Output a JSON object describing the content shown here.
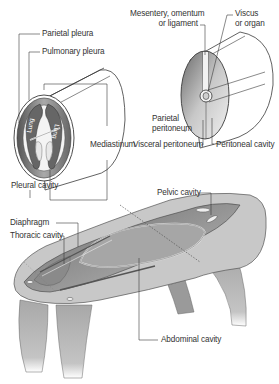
{
  "figure": {
    "panels": [
      {
        "id": "pleural",
        "description": "Cross-section of thoracic cylinder showing lungs, pleurae and mediastinum",
        "labels": {
          "parietal_pleura": "Parietal pleura",
          "pulmonary_pleura": "Pulmonary pleura",
          "mediastinum": "Mediastinum",
          "pleural_cavity": "Pleural cavity",
          "lung_left": "Lung",
          "lung_right": "Lung"
        }
      },
      {
        "id": "peritoneal",
        "description": "Cylinder section showing viscus suspended by mesentery within peritoneal cavity",
        "labels": {
          "mesentery_line1": "Mesentery, omentum",
          "mesentery_line2": "or ligament",
          "viscus_line1": "Viscus",
          "viscus_line2": "or organ",
          "parietal_peritoneum_line1": "Parietal",
          "parietal_peritoneum_line2": "peritoneum",
          "visceral_peritoneum": "Visceral peritoneum",
          "peritoneal_cavity": "Peritoneal cavity"
        }
      },
      {
        "id": "body-cavities",
        "description": "Quadruped torso opened to show body cavities",
        "labels": {
          "pelvic_cavity": "Pelvic cavity",
          "diaphragm": "Diaphragm",
          "thoracic_cavity": "Thoracic cavity",
          "abdominal_cavity": "Abdominal cavity"
        }
      }
    ],
    "colors": {
      "line": "#3a3a3a",
      "dark_fill": "#5a5a5a",
      "mid_fill": "#9a9a9a",
      "light_fill": "#d4d4d4",
      "body_fill": "#c8c8c8",
      "background": "#ffffff"
    }
  }
}
